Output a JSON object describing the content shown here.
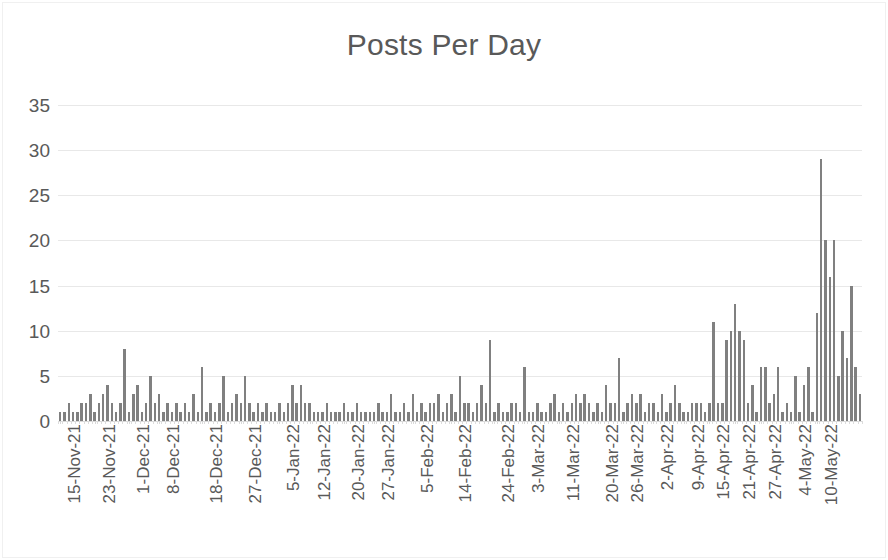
{
  "chart_data": {
    "type": "bar",
    "title": "Posts Per Day",
    "xlabel": "",
    "ylabel": "",
    "ylim": [
      0,
      35
    ],
    "ytick_labels": [
      "35",
      "30",
      "25",
      "20",
      "15",
      "10",
      "5",
      "0"
    ],
    "ytick_values": [
      35,
      30,
      25,
      20,
      15,
      10,
      5,
      0
    ],
    "grid": true,
    "legend": "none",
    "bar_color": "#808080",
    "text_color": "#595959",
    "gridline_color": "#e8e8e8",
    "x_start_date": "15-Nov-21",
    "x_end_date": "13-May-22",
    "xtick_labels": [
      "15-Nov-21",
      "23-Nov-21",
      "1-Dec-21",
      "8-Dec-21",
      "18-Dec-21",
      "27-Dec-21",
      "5-Jan-22",
      "12-Jan-22",
      "20-Jan-22",
      "27-Jan-22",
      "5-Feb-22",
      "14-Feb-22",
      "24-Feb-22",
      "3-Mar-22",
      "11-Mar-22",
      "20-Mar-22",
      "26-Mar-22",
      "2-Apr-22",
      "9-Apr-22",
      "15-Apr-22",
      "21-Apr-22",
      "27-Apr-22",
      "4-May-22",
      "10-May-22"
    ],
    "xtick_indices": [
      0,
      8,
      16,
      23,
      33,
      42,
      51,
      58,
      66,
      73,
      82,
      91,
      101,
      108,
      116,
      125,
      131,
      138,
      145,
      151,
      157,
      163,
      170,
      176
    ],
    "values": [
      1,
      1,
      2,
      1,
      1,
      2,
      2,
      3,
      1,
      2,
      3,
      4,
      2,
      1,
      2,
      8,
      1,
      3,
      4,
      1,
      2,
      5,
      2,
      3,
      1,
      2,
      1,
      2,
      1,
      2,
      1,
      3,
      1,
      6,
      1,
      2,
      1,
      2,
      5,
      1,
      2,
      3,
      2,
      5,
      2,
      1,
      2,
      1,
      2,
      1,
      1,
      2,
      1,
      2,
      4,
      2,
      4,
      2,
      2,
      1,
      1,
      1,
      2,
      1,
      1,
      1,
      2,
      1,
      1,
      2,
      1,
      1,
      1,
      1,
      2,
      1,
      1,
      3,
      1,
      1,
      2,
      1,
      3,
      1,
      2,
      1,
      2,
      2,
      3,
      1,
      2,
      3,
      1,
      5,
      2,
      2,
      1,
      2,
      4,
      2,
      9,
      1,
      2,
      1,
      1,
      2,
      2,
      1,
      6,
      1,
      1,
      2,
      1,
      1,
      2,
      3,
      1,
      2,
      1,
      2,
      3,
      2,
      3,
      2,
      1,
      2,
      1,
      4,
      2,
      2,
      7,
      1,
      2,
      3,
      2,
      3,
      1,
      2,
      2,
      1,
      3,
      1,
      2,
      4,
      2,
      1,
      1,
      2,
      2,
      2,
      1,
      2,
      11,
      2,
      2,
      9,
      10,
      13,
      10,
      9,
      2,
      4,
      1,
      6,
      6,
      2,
      3,
      6,
      1,
      2,
      1,
      5,
      1,
      4,
      6,
      1,
      12,
      29,
      20,
      16,
      20,
      5,
      10,
      7,
      15,
      6,
      3
    ]
  }
}
